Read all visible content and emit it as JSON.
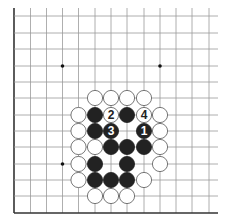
{
  "diagram": {
    "type": "go-board-problem",
    "view": "bottom-left corner",
    "grid": {
      "columns": 13,
      "rows": 13,
      "x_positions": [
        14,
        30.5,
        46.5,
        62.5,
        78.5,
        95,
        111,
        127,
        144,
        160,
        176,
        192,
        209
      ],
      "y_positions": [
        16,
        33,
        49,
        66,
        82,
        98,
        115,
        131,
        147,
        164,
        180,
        196,
        213
      ],
      "line_extent": {
        "top": 8,
        "right": 218
      },
      "edges": {
        "left": true,
        "bottom": true,
        "top": false,
        "right": false
      },
      "line_color": "#9a9a9a",
      "edge_color": "#333333"
    },
    "star_points": [
      {
        "col": 3,
        "row": 3
      },
      {
        "col": 9,
        "row": 3
      },
      {
        "col": 3,
        "row": 9
      }
    ],
    "stones": [
      {
        "color": "white",
        "col": 5,
        "row": 5,
        "label": ""
      },
      {
        "color": "white",
        "col": 6,
        "row": 5,
        "label": ""
      },
      {
        "color": "white",
        "col": 7,
        "row": 5,
        "label": ""
      },
      {
        "color": "white",
        "col": 8,
        "row": 5,
        "label": ""
      },
      {
        "color": "white",
        "col": 4,
        "row": 6,
        "label": ""
      },
      {
        "color": "black",
        "col": 5,
        "row": 6,
        "label": ""
      },
      {
        "color": "white",
        "col": 6,
        "row": 6,
        "label": "2"
      },
      {
        "color": "black",
        "col": 7,
        "row": 6,
        "label": ""
      },
      {
        "color": "white",
        "col": 8,
        "row": 6,
        "label": "4"
      },
      {
        "color": "white",
        "col": 9,
        "row": 6,
        "label": ""
      },
      {
        "color": "white",
        "col": 4,
        "row": 7,
        "label": ""
      },
      {
        "color": "black",
        "col": 5,
        "row": 7,
        "label": ""
      },
      {
        "color": "black",
        "col": 6,
        "row": 7,
        "label": "3"
      },
      {
        "color": "black",
        "col": 8,
        "row": 7,
        "label": "1"
      },
      {
        "color": "white",
        "col": 9,
        "row": 7,
        "label": ""
      },
      {
        "color": "white",
        "col": 4,
        "row": 8,
        "label": ""
      },
      {
        "color": "white",
        "col": 5,
        "row": 8,
        "label": ""
      },
      {
        "color": "black",
        "col": 6,
        "row": 8,
        "label": ""
      },
      {
        "color": "black",
        "col": 7,
        "row": 8,
        "label": ""
      },
      {
        "color": "black",
        "col": 8,
        "row": 8,
        "label": ""
      },
      {
        "color": "white",
        "col": 9,
        "row": 8,
        "label": ""
      },
      {
        "color": "white",
        "col": 4,
        "row": 9,
        "label": ""
      },
      {
        "color": "black",
        "col": 5,
        "row": 9,
        "label": ""
      },
      {
        "color": "black",
        "col": 7,
        "row": 9,
        "label": ""
      },
      {
        "color": "white",
        "col": 9,
        "row": 9,
        "label": ""
      },
      {
        "color": "white",
        "col": 4,
        "row": 10,
        "label": ""
      },
      {
        "color": "black",
        "col": 5,
        "row": 10,
        "label": ""
      },
      {
        "color": "black",
        "col": 6,
        "row": 10,
        "label": ""
      },
      {
        "color": "black",
        "col": 7,
        "row": 10,
        "label": ""
      },
      {
        "color": "white",
        "col": 8,
        "row": 10,
        "label": ""
      },
      {
        "color": "white",
        "col": 5,
        "row": 11,
        "label": ""
      },
      {
        "color": "white",
        "col": 6,
        "row": 11,
        "label": ""
      },
      {
        "color": "white",
        "col": 7,
        "row": 11,
        "label": ""
      }
    ],
    "move_labels": [
      "1",
      "2",
      "3",
      "4"
    ],
    "colors": {
      "black_stone": "#222222",
      "white_stone_fill": "#ffffff",
      "white_stone_stroke": "#555555",
      "label_on_black": "#ffffff",
      "label_on_white": "#222222"
    }
  }
}
